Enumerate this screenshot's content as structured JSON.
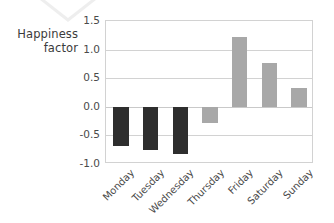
{
  "chart_data": {
    "type": "bar",
    "title": "",
    "subtitle": "",
    "xlabel": "",
    "ylabel": "Happiness factor",
    "ylabel_line1": "Happiness",
    "ylabel_line2": "factor",
    "categories": [
      "Monday",
      "Tuesday",
      "Wednesday",
      "Thursday",
      "Friday",
      "Saturday",
      "Sunday"
    ],
    "values": [
      -0.69,
      -0.76,
      -0.83,
      -0.29,
      1.22,
      0.76,
      0.32
    ],
    "bar_colors": [
      "#2e2e2e",
      "#2e2e2e",
      "#2e2e2e",
      "#a8a8a8",
      "#a8a8a8",
      "#a8a8a8",
      "#a8a8a8"
    ],
    "ylim": [
      -1.0,
      1.5
    ],
    "yticks": [
      1.5,
      1.0,
      0.5,
      0.0,
      -0.5,
      -1.0
    ],
    "ytick_labels": [
      "1.5",
      "1.0",
      "0.5",
      "0.0",
      "-0.5",
      "-1.0"
    ],
    "grid": true,
    "grid_axis": "y",
    "legend": null,
    "xtick_rotation": -45,
    "annotations": []
  },
  "axis": {
    "y_title_line1": "Happiness",
    "y_title_line2": "factor"
  },
  "colors": {
    "dark_bar": "#2e2e2e",
    "light_bar": "#a8a8a8",
    "gridline": "#d2d2d2",
    "frame": "#d2d2d2",
    "tick_text": "#4a4a4a",
    "title_text": "#3b3b3b",
    "background": "#ffffff"
  }
}
